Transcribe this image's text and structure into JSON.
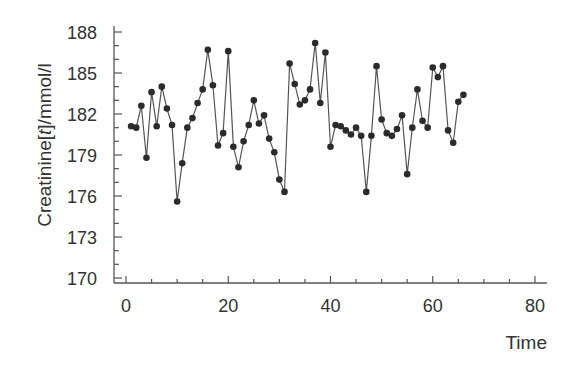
{
  "chart_data": {
    "type": "line",
    "title": "",
    "xlabel": "Time",
    "ylabel": "Creatinine[t]/mmol/l",
    "ylabel_parts": {
      "prefix": "Creatinine[",
      "italic": "t",
      "suffix": "]/mmol/l"
    },
    "xlim": [
      -2.5,
      83
    ],
    "ylim": [
      169.6,
      188.6
    ],
    "x_ticks": [
      0,
      20,
      40,
      60,
      80
    ],
    "x_minor_step": 5,
    "y_ticks": [
      170,
      173,
      176,
      179,
      182,
      185,
      188
    ],
    "y_minor_step": 1,
    "grid": false,
    "legend": null,
    "marker": "filled-circle",
    "line_color": "#555555",
    "marker_color": "#2b2b2b",
    "series": [
      {
        "name": "Creatinine",
        "x": [
          1,
          2,
          3,
          4,
          5,
          6,
          7,
          8,
          9,
          10,
          11,
          12,
          13,
          14,
          15,
          16,
          17,
          18,
          19,
          20,
          21,
          22,
          23,
          24,
          25,
          26,
          27,
          28,
          29,
          30,
          31,
          32,
          33,
          34,
          35,
          36,
          37,
          38,
          39,
          40,
          41,
          42,
          43,
          44,
          45,
          46,
          47,
          48,
          49,
          50,
          51,
          52,
          53,
          54,
          55,
          56,
          57,
          58,
          59,
          60,
          61,
          62,
          63,
          64,
          65,
          66
        ],
        "values": [
          181.1,
          181.0,
          182.6,
          178.8,
          183.6,
          181.1,
          184.0,
          182.4,
          181.2,
          175.6,
          178.4,
          181.0,
          181.7,
          182.8,
          183.8,
          186.7,
          184.1,
          179.7,
          180.6,
          186.6,
          179.6,
          178.1,
          180.0,
          181.2,
          183.0,
          181.3,
          181.9,
          180.2,
          179.2,
          177.2,
          176.3,
          185.7,
          184.2,
          182.7,
          183.0,
          183.8,
          187.2,
          182.8,
          186.5,
          179.6,
          181.2,
          181.1,
          180.8,
          180.5,
          181.0,
          180.4,
          176.3,
          180.4,
          185.5,
          181.6,
          180.6,
          180.4,
          180.9,
          181.9,
          177.6,
          181.0,
          183.8,
          181.5,
          181.0,
          185.4,
          184.7,
          185.5,
          180.8,
          179.9,
          182.9,
          183.4
        ]
      }
    ]
  }
}
